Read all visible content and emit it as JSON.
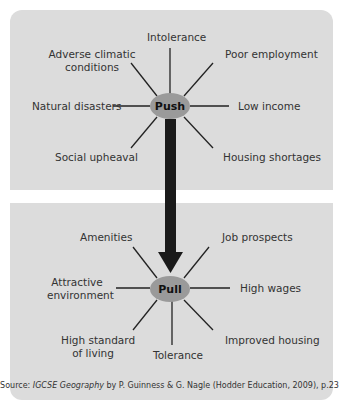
{
  "push": {
    "center": "Push",
    "factors": {
      "top": "Intolerance",
      "top_left": [
        "Adverse climatic",
        "conditions"
      ],
      "top_right": "Poor employment",
      "left": "Natural disasters",
      "right": "Low income",
      "bottom_left": "Social upheaval",
      "bottom_right": "Housing shortages"
    }
  },
  "pull": {
    "center": "Pull",
    "factors": {
      "top_left": "Amenities",
      "top_right": "Job prospects",
      "left": [
        "Attractive",
        "environment"
      ],
      "right": "High wages",
      "bottom_left": [
        "High standard",
        "of living"
      ],
      "bottom": "Tolerance",
      "bottom_right": "Improved housing"
    }
  },
  "source": {
    "prefix": "Source: ",
    "title": "IGCSE Geography",
    "suffix": " by P. Guinness & G. Nagle (Hodder Education, 2009), p.23"
  },
  "colors": {
    "panel": "#dcdcdc",
    "node": "#9a9a9a",
    "arrow": "#1a1a1a"
  }
}
